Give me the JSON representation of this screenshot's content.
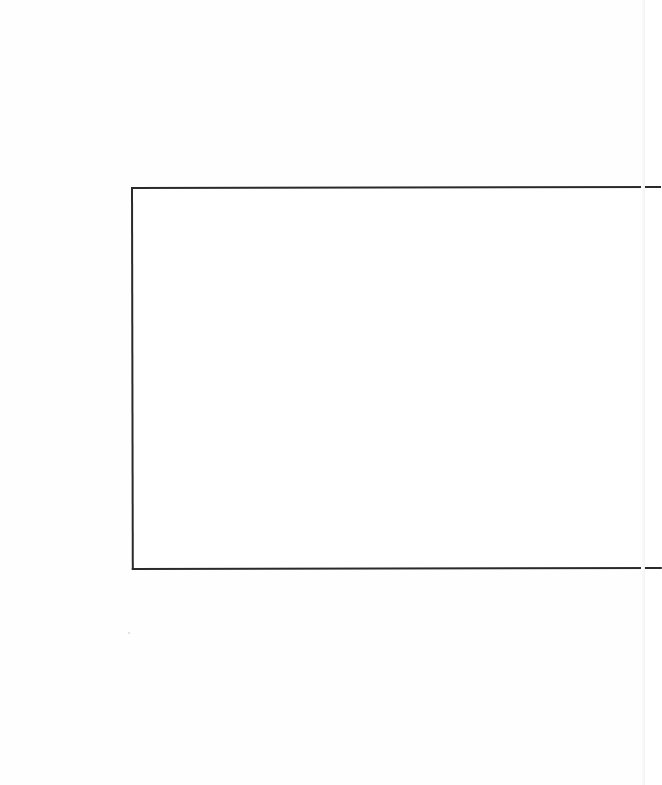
{
  "document": {
    "page": {
      "background": "#fefefe",
      "content_text": ""
    },
    "frame": {
      "label": "",
      "border_color": "#2a2a2a",
      "fill_color": "#ffffff"
    }
  }
}
